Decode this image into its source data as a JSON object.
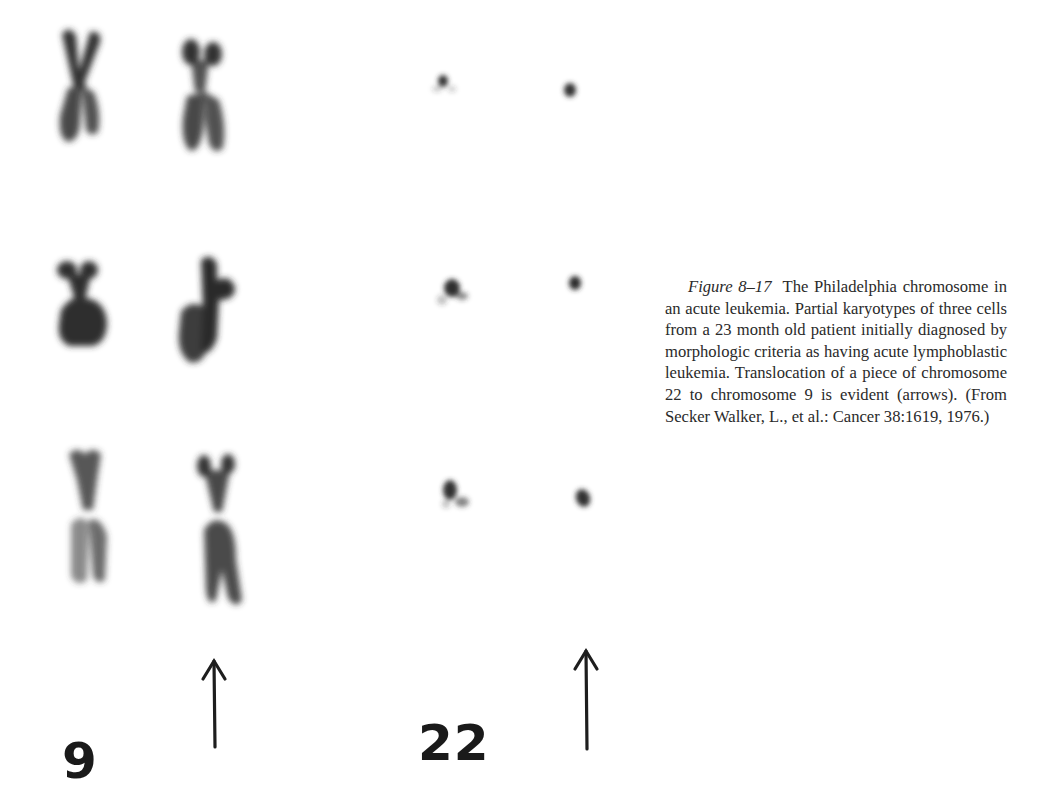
{
  "figure": {
    "number": "Figure 8–17",
    "title": "The Philadelphia chromosome in an acute leukemia.",
    "caption_body": "Partial karyotypes of three cells from a 23 month old patient initially diagnosed by morphologic criteria as having acute lymphoblastic leukemia. Translocation of a piece of chromosome 22 to chromosome 9 is evident (arrows). (From Secker Walker, L., et al.: Cancer 38:1619, 1976.)",
    "caption_lines": [
      "The Philadelphia",
      "chromosome in an acute leukemia.",
      "Partial karyotypes of three cells",
      "from a 23 month old patient initi-",
      "ally diagnosed by morphologic",
      "criteria as having acute lympho-",
      "blastic leukemia. Translocation of a",
      "piece of chromosome 22 to chromo-",
      "some 9 is evident (arrows). (From",
      "Secker Walker, L., et al.: Cancer",
      "38:1619, 1976.)"
    ],
    "citation": {
      "authors": "Secker Walker, L., et al.",
      "journal": "Cancer",
      "volume": "38",
      "page": "1619",
      "year": "1976"
    }
  },
  "karyotype": {
    "cells": 3,
    "columns": [
      {
        "id": "chr9-normal",
        "chromosome": "9",
        "type": "normal"
      },
      {
        "id": "chr9-derived",
        "chromosome": "9",
        "type": "derivative (arrow)"
      },
      {
        "id": "chr22-normal",
        "chromosome": "22",
        "type": "normal"
      },
      {
        "id": "chr22-ph",
        "chromosome": "22",
        "type": "Philadelphia (arrow)"
      }
    ],
    "labels": {
      "chr9": "9",
      "chr22": "22"
    },
    "arrow_glyph": "↑",
    "ink_color": "#2b2b2b"
  }
}
